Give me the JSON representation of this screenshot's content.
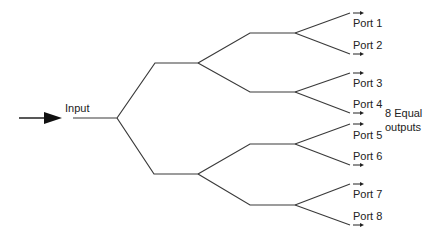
{
  "diagram": {
    "type": "1-to-8 binary splitter tree",
    "input_label": "Input",
    "annotation_line1": "8 Equal",
    "annotation_line2": "outputs",
    "line_color": "#3a3a3a",
    "ports": [
      {
        "label": "Port 1"
      },
      {
        "label": "Port 2"
      },
      {
        "label": "Port 3"
      },
      {
        "label": "Port 4"
      },
      {
        "label": "Port 5"
      },
      {
        "label": "Port 6"
      },
      {
        "label": "Port 7"
      },
      {
        "label": "Port 8"
      }
    ]
  }
}
